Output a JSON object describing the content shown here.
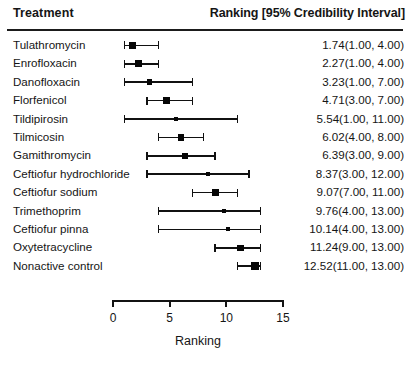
{
  "header": {
    "treatment_label": "Treatment",
    "ranking_label": "Ranking [95% Credibility Interval]"
  },
  "axis": {
    "title": "Ranking",
    "ticks": [
      "0",
      "5",
      "10",
      "15"
    ],
    "tick_values": [
      0,
      5,
      10,
      15
    ],
    "min": 0,
    "max": 15
  },
  "colors": {
    "marker": "#060606",
    "line": "#111111",
    "rule": "#1b1b1b",
    "text": "#151515",
    "background": "#ffffff"
  },
  "rows": [
    {
      "label": "Tulathromycin",
      "value": "1.74(1.00,  4.00)",
      "mean": 1.74,
      "low": 1.0,
      "high": 4.0,
      "marker": 7.5
    },
    {
      "label": "Enrofloxacin",
      "value": "2.27(1.00,  4.00)",
      "mean": 2.27,
      "low": 1.0,
      "high": 4.0,
      "marker": 7.0
    },
    {
      "label": "Danofloxacin",
      "value": "3.23(1.00,  7.00)",
      "mean": 3.23,
      "low": 1.0,
      "high": 7.0,
      "marker": 5.5
    },
    {
      "label": "Florfenicol",
      "value": "4.71(3.00,  7.00)",
      "mean": 4.71,
      "low": 3.0,
      "high": 7.0,
      "marker": 7.5
    },
    {
      "label": "Tildipirosin",
      "value": "5.54(1.00, 11.00)",
      "mean": 5.54,
      "low": 1.0,
      "high": 11.0,
      "marker": 4.0
    },
    {
      "label": "Tilmicosin",
      "value": "6.02(4.00,  8.00)",
      "mean": 6.02,
      "low": 4.0,
      "high": 8.0,
      "marker": 6.5
    },
    {
      "label": "Gamithromycin",
      "value": "6.39(3.00,  9.00)",
      "mean": 6.39,
      "low": 3.0,
      "high": 9.0,
      "marker": 6.0
    },
    {
      "label": "Ceftiofur hydrochloride",
      "value": "8.37(3.00, 12.00)",
      "mean": 8.37,
      "low": 3.0,
      "high": 12.0,
      "marker": 4.0
    },
    {
      "label": "Ceftiofur sodium",
      "value": "9.07(7.00, 11.00)",
      "mean": 9.07,
      "low": 7.0,
      "high": 11.0,
      "marker": 7.0
    },
    {
      "label": "Trimethoprim",
      "value": "9.76(4.00, 13.00)",
      "mean": 9.76,
      "low": 4.0,
      "high": 13.0,
      "marker": 4.0
    },
    {
      "label": "Ceftiofur pinna",
      "value": "10.14(4.00, 13.00)",
      "mean": 10.14,
      "low": 4.0,
      "high": 13.0,
      "marker": 4.0
    },
    {
      "label": "Oxytetracycline",
      "value": "11.24(9.00, 13.00)",
      "mean": 11.24,
      "low": 9.0,
      "high": 13.0,
      "marker": 6.5
    },
    {
      "label": "Nonactive control",
      "value": "12.52(11.00, 13.00)",
      "mean": 12.52,
      "low": 11.0,
      "high": 13.0,
      "marker": 8.5
    }
  ],
  "chart_data": {
    "type": "scatter",
    "title": "",
    "xlabel": "Ranking",
    "ylabel": "Treatment",
    "xlim": [
      0,
      15
    ],
    "xticks": [
      0,
      5,
      10,
      15
    ],
    "grid": false,
    "legend": "none",
    "categories": [
      "Tulathromycin",
      "Enrofloxacin",
      "Danofloxacin",
      "Florfenicol",
      "Tildipirosin",
      "Tilmicosin",
      "Gamithromycin",
      "Ceftiofur hydrochloride",
      "Ceftiofur sodium",
      "Trimethoprim",
      "Ceftiofur pinna",
      "Oxytetracycline",
      "Nonactive control"
    ],
    "values": [
      1.74,
      2.27,
      3.23,
      4.71,
      5.54,
      6.02,
      6.39,
      8.37,
      9.07,
      9.76,
      10.14,
      11.24,
      12.52
    ],
    "ci_lower": [
      1.0,
      1.0,
      1.0,
      3.0,
      1.0,
      4.0,
      3.0,
      3.0,
      7.0,
      4.0,
      4.0,
      9.0,
      11.0
    ],
    "ci_upper": [
      4.0,
      4.0,
      7.0,
      7.0,
      11.0,
      8.0,
      9.0,
      12.0,
      11.0,
      13.0,
      13.0,
      13.0,
      13.0
    ],
    "annotations": [
      "1.74(1.00,  4.00)",
      "2.27(1.00,  4.00)",
      "3.23(1.00,  7.00)",
      "4.71(3.00,  7.00)",
      "5.54(1.00, 11.00)",
      "6.02(4.00,  8.00)",
      "6.39(3.00,  9.00)",
      "8.37(3.00, 12.00)",
      "9.07(7.00, 11.00)",
      "9.76(4.00, 13.00)",
      "10.14(4.00, 13.00)",
      "11.24(9.00, 13.00)",
      "12.52(11.00, 13.00)"
    ]
  }
}
